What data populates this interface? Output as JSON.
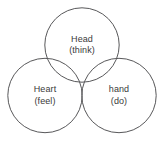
{
  "diagram": {
    "type": "venn-three-circle",
    "background_color": "#ffffff",
    "stroke_color": "#58585a",
    "text_color": "#3a3a3a",
    "width": 165,
    "height": 148,
    "circles": [
      {
        "id": "head",
        "label": "Head",
        "sublabel": "(think)",
        "position": "top",
        "cx": 82,
        "cy": 45,
        "r": 37.5
      },
      {
        "id": "heart",
        "label": "Heart",
        "sublabel": "(feel)",
        "position": "bottom-left",
        "cx": 45,
        "cy": 95.5,
        "r": 37.5
      },
      {
        "id": "hand",
        "label": "hand",
        "sublabel": "(do)",
        "position": "bottom-right",
        "cx": 119,
        "cy": 95.5,
        "r": 37.5
      }
    ]
  }
}
